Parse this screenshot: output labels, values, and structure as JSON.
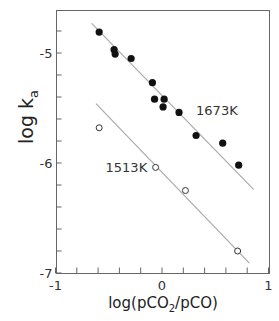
{
  "chart_data": {
    "type": "scatter",
    "title": "",
    "xlabel": "log(pCO2/pCO)",
    "xlabel_parts": {
      "pre": "log(pCO",
      "sub": "2",
      "post": "/pCO)"
    },
    "ylabel": "log ka",
    "ylabel_parts": {
      "main": "log k",
      "sub": "a"
    },
    "xlim": [
      -1,
      1
    ],
    "ylim": [
      -7,
      -4.6
    ],
    "x_ticks": [
      -1,
      0,
      1
    ],
    "x_tick_labels": [
      "-1",
      "0",
      "1"
    ],
    "x_minor_step": 0.2,
    "y_ticks": [
      -7,
      -6,
      -5
    ],
    "y_tick_labels": [
      "-7",
      "-6",
      "-5"
    ],
    "y_minor_step": 0.2,
    "grid": false,
    "legend": null,
    "series": [
      {
        "name": "1673K",
        "marker": "filled-circle",
        "color": "#111111",
        "points": [
          {
            "x": -0.59,
            "y": -4.81
          },
          {
            "x": -0.45,
            "y": -4.97
          },
          {
            "x": -0.44,
            "y": -5.01
          },
          {
            "x": -0.29,
            "y": -5.05
          },
          {
            "x": -0.09,
            "y": -5.27
          },
          {
            "x": -0.07,
            "y": -5.42
          },
          {
            "x": 0.02,
            "y": -5.42
          },
          {
            "x": 0.01,
            "y": -5.49
          },
          {
            "x": 0.16,
            "y": -5.54
          },
          {
            "x": 0.32,
            "y": -5.75
          },
          {
            "x": 0.57,
            "y": -5.82
          },
          {
            "x": 0.72,
            "y": -6.02
          }
        ],
        "fit_line": {
          "x1": -0.66,
          "y1": -4.73,
          "x2": 0.86,
          "y2": -6.24
        },
        "label": {
          "text": "1673K",
          "x": 0.32,
          "y": -5.52
        }
      },
      {
        "name": "1513K",
        "marker": "open-circle",
        "color": "#333333",
        "points": [
          {
            "x": -0.59,
            "y": -5.68
          },
          {
            "x": -0.06,
            "y": -6.04
          },
          {
            "x": 0.22,
            "y": -6.25
          },
          {
            "x": 0.71,
            "y": -6.8
          }
        ],
        "fit_line": {
          "x1": -0.62,
          "y1": -5.46,
          "x2": 0.82,
          "y2": -6.91
        },
        "label": {
          "text": "1513K",
          "x": -0.53,
          "y": -6.04
        }
      }
    ],
    "annotations": [
      "1673K",
      "1513K"
    ],
    "colors": {
      "axis": "#555555",
      "fit_line": "#aaaaaa",
      "marker": "#111111"
    }
  }
}
